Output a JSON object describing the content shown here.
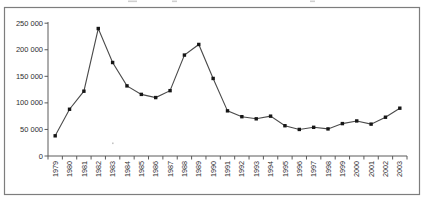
{
  "chart_data": {
    "type": "line",
    "title": "",
    "xlabel": "",
    "ylabel": "",
    "categories": [
      "1979",
      "1980",
      "1981",
      "1982",
      "1983",
      "1984",
      "1985",
      "1986",
      "1987",
      "1988",
      "1989",
      "1990",
      "1991",
      "1992",
      "1993",
      "1994",
      "1995",
      "1996",
      "1997",
      "1998",
      "1999",
      "2000",
      "2001",
      "2002",
      "2003"
    ],
    "values": [
      38000,
      88000,
      122000,
      240000,
      176000,
      132000,
      116000,
      110000,
      123000,
      190000,
      210000,
      146000,
      85000,
      74000,
      70000,
      75000,
      57000,
      50000,
      54000,
      51000,
      61000,
      66000,
      60000,
      73000,
      90000
    ],
    "ylim": [
      0,
      250000
    ],
    "ytick_step": 50000,
    "ytick_labels": [
      "0",
      "50 000",
      "100 000",
      "150 000",
      "200 000",
      "250 000"
    ],
    "grid": "off",
    "legend": "none",
    "marker": "square",
    "colors": {
      "line": "#4a4a4a",
      "marker": "#161616",
      "axis": "#5a5a5a",
      "tick_text": "#2e2e2e",
      "frame_border": "#7d7d7d",
      "plot_background": "#ffffff",
      "scan_artifact": "#c4c4c4"
    }
  }
}
